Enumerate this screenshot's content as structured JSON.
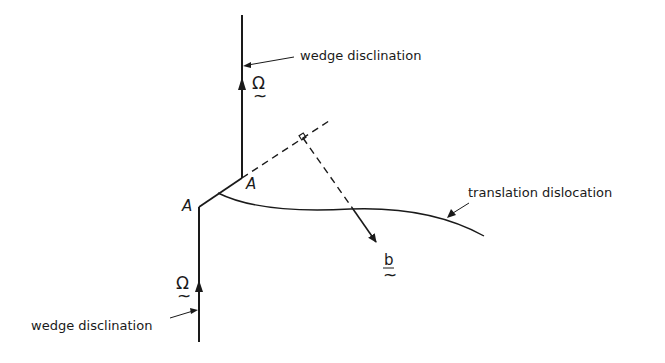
{
  "diagram": {
    "labels": {
      "wedge_top": "wedge disclination",
      "wedge_bottom": "wedge disclination",
      "translation": "translation dislocation",
      "omega_top": "Ω",
      "omega_bottom": "Ω",
      "burgers": "b",
      "tilde": "~",
      "point_a_left": "A",
      "point_a_right": "A"
    },
    "colors": {
      "line": "#1a1a1a",
      "background": "#ffffff"
    }
  }
}
